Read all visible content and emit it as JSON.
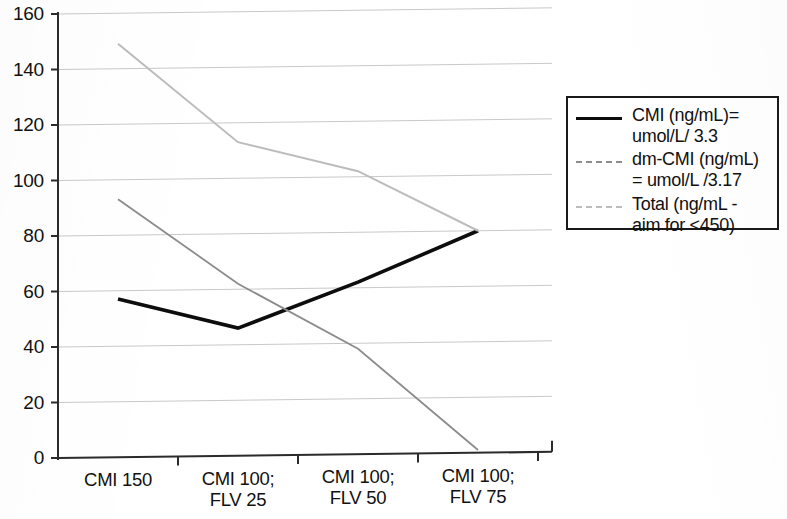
{
  "chart_data": {
    "type": "line",
    "title": "",
    "subtitle": "",
    "xlabel": "",
    "ylabel": "",
    "categories": [
      "CMI 150",
      "CMI 100; FLV 25",
      "CMI 100; FLV 50",
      "CMI 100; FLV 75"
    ],
    "category_lines": [
      [
        "CMI 150",
        ""
      ],
      [
        "CMI 100;",
        "FLV 25"
      ],
      [
        "CMI 100;",
        "FLV 50"
      ],
      [
        "CMI 100;",
        "FLV 75"
      ]
    ],
    "series": [
      {
        "name": "CMI (ng/mL)=\numol/L/ 3.3",
        "legend_line1": "CMI (ng/mL)=",
        "legend_line2": "umol/L/ 3.3",
        "values": [
          57,
          46,
          62,
          80
        ],
        "color": "#0d0d0d",
        "style": "solid",
        "width": 3.6
      },
      {
        "name": "dm-CMI (ng/mL)\n= umol/L /3.17",
        "legend_line1": "dm-CMI (ng/mL)",
        "legend_line2": "= umol/L /3.17",
        "values": [
          93,
          62,
          38,
          1
        ],
        "color": "#8c8c8c",
        "style": "solid",
        "width": 1.8
      },
      {
        "name": "Total (ng/mL -\naim for <450)",
        "legend_line1": "Total (ng/mL -",
        "legend_line2": "aim for <450)",
        "values": [
          149,
          113,
          102,
          80
        ],
        "color": "#bcbcbc",
        "style": "solid",
        "width": 2.0
      }
    ],
    "ylim": [
      0,
      160
    ],
    "ytick_step": 20,
    "yticks": [
      0,
      20,
      40,
      60,
      80,
      100,
      120,
      140,
      160
    ],
    "ytick_labels": [
      "0",
      "20",
      "40",
      "60",
      "80",
      "100",
      "120",
      "140",
      "160"
    ],
    "grid": true,
    "grid_axis": "y",
    "legend_position": "right",
    "legend_border_color": "#1a1a1a"
  },
  "legend": {
    "items": [
      {
        "line1": "CMI (ng/mL)=",
        "line2": "umol/L/ 3.3",
        "swatch": "solid-black-line-swatch"
      },
      {
        "line1": "dm-CMI (ng/mL)",
        "line2": "= umol/L /3.17",
        "swatch": "dashed-gray-line-swatch"
      },
      {
        "line1": "Total (ng/mL -",
        "line2": "aim for <450)",
        "swatch": "dashed-light-gray-line-swatch"
      }
    ]
  },
  "axis": {
    "y_labels": [
      "160",
      "140",
      "120",
      "100",
      "80",
      "60",
      "40",
      "20",
      "0"
    ],
    "x_labels": [
      {
        "line1": "CMI 150",
        "line2": ""
      },
      {
        "line1": "CMI 100;",
        "line2": "FLV 25"
      },
      {
        "line1": "CMI 100;",
        "line2": "FLV 50"
      },
      {
        "line1": "CMI 100;",
        "line2": "FLV 75"
      }
    ]
  }
}
